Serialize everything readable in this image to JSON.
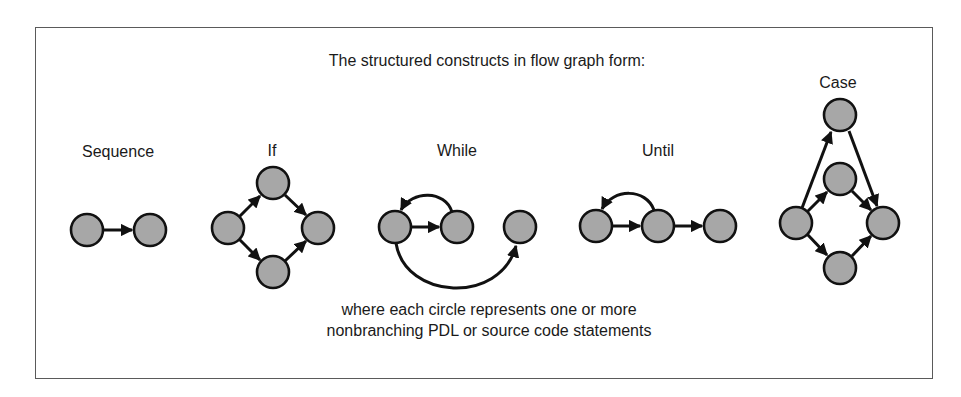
{
  "title": "The structured constructs in flow graph form:",
  "constructs": [
    {
      "name": "Sequence",
      "label_x": 118
    },
    {
      "name": "If",
      "label_x": 272
    },
    {
      "name": "While",
      "label_x": 457
    },
    {
      "name": "Until",
      "label_x": 658
    },
    {
      "name": "Case",
      "label_x": 838
    }
  ],
  "caption": {
    "line1": "where each circle represents one or more",
    "line2": "nonbranching PDL or source code statements"
  },
  "colors": {
    "node_fill": "#a7a7a7",
    "node_stroke": "#111111",
    "border": "#5a5a5a"
  }
}
